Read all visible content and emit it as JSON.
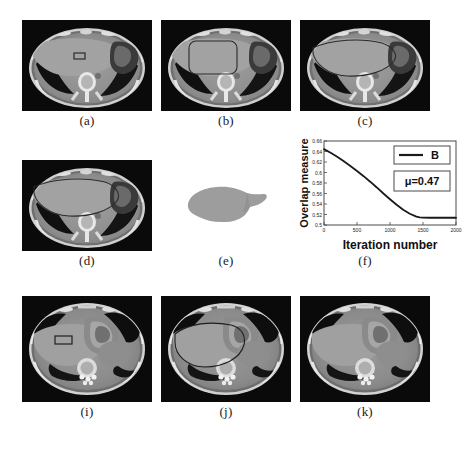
{
  "figure": {
    "title": "",
    "panels": [
      {
        "id": "a",
        "caption": "(a)",
        "kind": "ct-slice",
        "description": "axial abdominal CT with rectangular seed region on liver"
      },
      {
        "id": "b",
        "caption": "(b)",
        "kind": "ct-slice",
        "description": "axial abdominal CT with initial rounded-rectangle contour on liver"
      },
      {
        "id": "c",
        "caption": "(c)",
        "kind": "ct-slice",
        "description": "axial abdominal CT with evolved liver contour"
      },
      {
        "id": "d",
        "caption": "(d)",
        "kind": "ct-slice",
        "description": "axial abdominal CT with final liver segmentation contour"
      },
      {
        "id": "e",
        "caption": "(e)",
        "kind": "binary-mask",
        "description": "extracted grey liver mask on white background"
      },
      {
        "id": "f",
        "caption": "(f)",
        "kind": "chart",
        "description": "overlap measure convergence curve"
      },
      {
        "id": "i",
        "caption": "(i)",
        "kind": "ct-slice",
        "description": "second axial abdominal CT with rectangular seed region"
      },
      {
        "id": "j",
        "caption": "(j)",
        "kind": "ct-slice",
        "description": "second axial abdominal CT with initial contour"
      },
      {
        "id": "k",
        "caption": "(k)",
        "kind": "ct-slice",
        "description": "second axial abdominal CT final result"
      }
    ]
  },
  "chart_data": {
    "type": "line",
    "title": "",
    "xlabel": "Iteration number",
    "ylabel": "Overlap measure",
    "xlim": [
      0,
      2000
    ],
    "ylim": [
      0.5,
      0.66
    ],
    "xticks": [
      0,
      500,
      1000,
      1500,
      2000
    ],
    "xticklabels": [
      "0",
      "500",
      "1000",
      "1500",
      "2000"
    ],
    "yticks": [
      0.5,
      0.52,
      0.54,
      0.56,
      0.58,
      0.6,
      0.62,
      0.64,
      0.66
    ],
    "yticklabels": [
      "0.5",
      "0.52",
      "0.54",
      "0.56",
      "0.58",
      "0.6",
      "0.62",
      "0.64",
      "0.66"
    ],
    "grid": false,
    "legend": {
      "position": "top-right",
      "entries": [
        {
          "name": "B",
          "color": "#1a1a1a"
        }
      ]
    },
    "annotations": [
      {
        "text": "μ=0.47",
        "boxed": true,
        "position": "upper-right"
      }
    ],
    "series": [
      {
        "name": "B",
        "color": "#1a1a1a",
        "x": [
          0,
          100,
          200,
          300,
          400,
          500,
          600,
          700,
          800,
          900,
          1000,
          1100,
          1200,
          1300,
          1400,
          1450,
          1500,
          1600,
          1700,
          1800,
          1900,
          2000
        ],
        "y": [
          0.6445,
          0.6375,
          0.63,
          0.6215,
          0.6125,
          0.603,
          0.593,
          0.5825,
          0.5715,
          0.56,
          0.549,
          0.5385,
          0.529,
          0.5215,
          0.516,
          0.5145,
          0.514,
          0.5138,
          0.5138,
          0.5138,
          0.5138,
          0.5138
        ]
      }
    ]
  },
  "colors": {
    "ct_background": "#0a0a0a",
    "soft_tissue": "#8f8f8f",
    "liver": "#9a9a9a",
    "bone": "#ededed",
    "lung_air": "#111111",
    "contour": "#2b2b2b",
    "curve": "#1a1a1a",
    "mask_fill": "#9d9d9d",
    "page_background": "#ffffff"
  }
}
